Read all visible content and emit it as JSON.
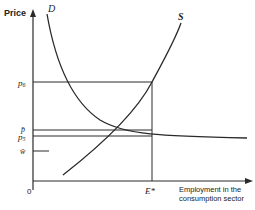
{
  "diagram": {
    "type": "supply-demand",
    "y_axis_label": "Price",
    "x_axis_label_line1": "Employment in the",
    "x_axis_label_line2": "consumption sector",
    "origin_label": "0",
    "curves": {
      "demand": {
        "label": "D"
      },
      "supply": {
        "label": "S"
      }
    },
    "price_levels": {
      "p6": {
        "label_main": "p",
        "label_sub": "6"
      },
      "p_bar": {
        "label": "p̄"
      },
      "p5": {
        "label_main": "p",
        "label_sub": "5"
      },
      "w_bar": {
        "label": "w̄"
      }
    },
    "x_marker": {
      "label": "E*"
    },
    "colors": {
      "line": "#2a2a2a",
      "text": "#222222",
      "background": "#ffffff"
    }
  }
}
